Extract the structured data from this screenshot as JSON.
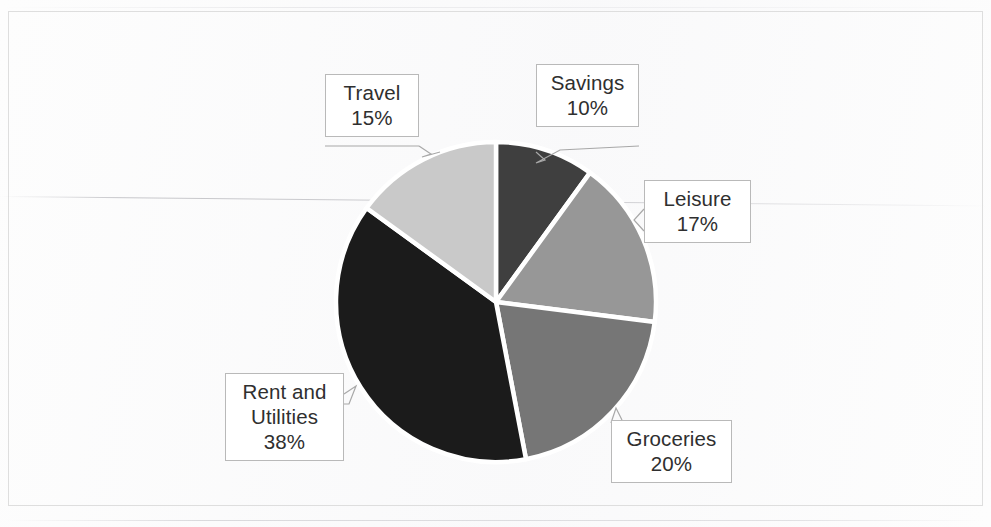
{
  "chart_data": {
    "type": "pie",
    "title": "",
    "subtitle": "",
    "xlabel": "",
    "ylabel": "",
    "legend_position": "none",
    "grid": false,
    "labels_style": "callout-boxes-with-leader-lines",
    "units": "percent",
    "total": 100,
    "categories": [
      "Savings",
      "Leisure",
      "Groceries",
      "Rent and Utilities",
      "Travel"
    ],
    "values": [
      10,
      17,
      20,
      38,
      15
    ],
    "start_angle_deg": 0,
    "direction": "clockwise",
    "slices": [
      {
        "name": "Savings",
        "label": "Savings",
        "value": 10,
        "value_label": "10%",
        "color": "#3f3f3f",
        "start_deg": 0,
        "end_deg": 36
      },
      {
        "name": "Leisure",
        "label": "Leisure",
        "value": 17,
        "value_label": "17%",
        "color": "#979797",
        "start_deg": 36,
        "end_deg": 97.2
      },
      {
        "name": "Groceries",
        "label": "Groceries",
        "value": 20,
        "value_label": "20%",
        "color": "#767676",
        "start_deg": 97.2,
        "end_deg": 169.2
      },
      {
        "name": "Rent and Utilities",
        "label": "Rent and",
        "label_line2": "Utilities",
        "value": 38,
        "value_label": "38%",
        "color": "#1b1b1b",
        "start_deg": 169.2,
        "end_deg": 306
      },
      {
        "name": "Travel",
        "label": "Travel",
        "value": 15,
        "value_label": "15%",
        "color": "#c9c9c9",
        "start_deg": 306,
        "end_deg": 360
      }
    ]
  },
  "figure": {
    "frame_color": "#dedede",
    "background": "#ffffff",
    "slice_separator_color": "#ffffff",
    "callout_border_color": "#b9b9b9",
    "callout_background": "#ffffff",
    "text_color": "#2f2f2f",
    "leader_line_color": "#a8a8a8"
  }
}
